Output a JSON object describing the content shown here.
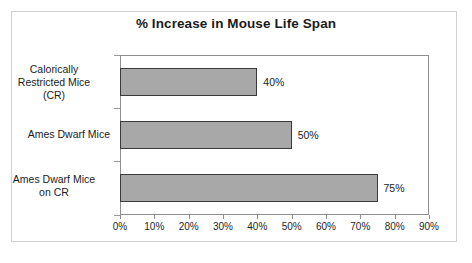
{
  "chart_data": {
    "type": "bar",
    "orientation": "horizontal",
    "title": "% Increase in Mouse Life Span",
    "xlabel": "",
    "ylabel": "",
    "categories": [
      "Calorically Restricted Mice (CR)",
      "Ames Dwarf Mice",
      "Ames Dwarf Mice on CR"
    ],
    "category_lines": [
      [
        "Calorically",
        "Restricted Mice",
        "(CR)"
      ],
      [
        "Ames Dwarf Mice"
      ],
      [
        "Ames Dwarf Mice",
        "on CR"
      ]
    ],
    "values": [
      40,
      50,
      75
    ],
    "value_labels": [
      "40%",
      "50%",
      "75%"
    ],
    "xlim": [
      0,
      90
    ],
    "xticks": [
      0,
      10,
      20,
      30,
      40,
      50,
      60,
      70,
      80,
      90
    ],
    "xtick_labels": [
      "0%",
      "10%",
      "20%",
      "30%",
      "40%",
      "50%",
      "60%",
      "70%",
      "80%",
      "90%"
    ],
    "grid": false,
    "legend": false,
    "colors": {
      "bar_fill": "#a8a8a8",
      "bar_border": "#3a3a3a",
      "plot_border": "#8e8e8e",
      "page_border": "#d2d2d2",
      "text": "#1b1b1b",
      "background": "#ffffff"
    }
  }
}
